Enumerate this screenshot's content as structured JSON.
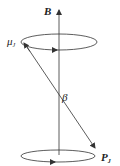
{
  "diagram": {
    "type": "vector-precession",
    "labels": {
      "field": "B",
      "moment": "μ",
      "moment_sub": "J",
      "angle": "β",
      "momentum": "P",
      "momentum_sub": "J"
    },
    "colors": {
      "stroke": "#333333",
      "text": "#222222",
      "background": "#ffffff"
    }
  }
}
